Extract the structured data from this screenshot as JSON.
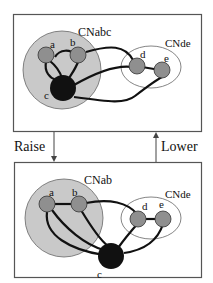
{
  "colors": {
    "cluster_fill": "#c9c9c9",
    "node_fill": "#8f8f8f",
    "master_fill": "#111111",
    "edge": "#111111",
    "frame": "#555555"
  },
  "top_panel": {
    "cluster_big_label": "CNabc",
    "cluster_small_label": "CNde",
    "nodes": [
      "a",
      "b",
      "c",
      "d",
      "e"
    ]
  },
  "bottom_panel": {
    "cluster_big_label": "CNab",
    "cluster_small_label": "CNde",
    "nodes": [
      "a",
      "b",
      "c",
      "d",
      "e"
    ]
  },
  "arrows": {
    "raise_label": "Raise",
    "lower_label": "Lower"
  }
}
